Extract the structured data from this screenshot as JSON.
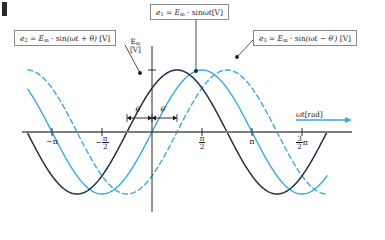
{
  "figure": {
    "title_mark": "corner-mark",
    "colors": {
      "series_e1": "#3aa9dd",
      "series_e2": "#1f3044",
      "series_e3": "#3aa9dd",
      "axis": "#7d7d7d",
      "arrow": "#3aa9dd",
      "box_border": "#8a8a8a",
      "text": "#1a1a1a"
    }
  },
  "callouts": {
    "e1": {
      "id": "callout-e1",
      "text": "e₁ = Em · sinωt[V]",
      "lhs": "e",
      "lhs_sub": "1",
      "eq": "=",
      "amp": "E",
      "amp_sub": "m",
      "dot": "·",
      "rhs": "sin",
      "arg": "ωt",
      "unit": "[V]"
    },
    "e2": {
      "id": "callout-e2",
      "text": "e₂ = Em · sin(ωt + θ) [V]",
      "lhs": "e",
      "lhs_sub": "2",
      "eq": "=",
      "amp": "E",
      "amp_sub": "m",
      "dot": "·",
      "rhs": "sin",
      "arg": "(ωt + θ)",
      "unit": "[V]"
    },
    "e3": {
      "id": "callout-e3",
      "text": "e₃ = Em · sin(ωt − θ′) [V]",
      "lhs": "e",
      "lhs_sub": "3",
      "eq": "=",
      "amp": "E",
      "amp_sub": "m",
      "dot": "·",
      "rhs": "sin",
      "arg": "(ωt − θ′)",
      "unit": "[V]"
    }
  },
  "axes": {
    "y_label_top": "Em",
    "y_label_sym": "E",
    "y_label_sub": "m",
    "y_label_unit": "[V]",
    "x_label": "ωt [rad]",
    "x_label_sym": "ωt",
    "x_label_unit": "[rad]"
  },
  "ticks": [
    {
      "label": "−π",
      "kind": "plain",
      "x_rad": -3.14159
    },
    {
      "label": "−π/2",
      "kind": "frac",
      "sign": "−",
      "num": "π",
      "den": "2",
      "x_rad": -1.5708
    },
    {
      "label": "π/2",
      "kind": "frac",
      "sign": "",
      "num": "π",
      "den": "2",
      "x_rad": 1.5708
    },
    {
      "label": "π",
      "kind": "plain",
      "x_rad": 3.14159
    },
    {
      "label": "3/2 π",
      "kind": "fracpi",
      "sign": "",
      "num": "3",
      "den": "2",
      "suffix": "π",
      "x_rad": 4.71239
    }
  ],
  "angle_annotations": [
    {
      "name": "theta",
      "label": "θ",
      "from_rad": -0.7854,
      "to_rad": 0.0
    },
    {
      "name": "theta-prime",
      "label": "θ′",
      "from_rad": 0.0,
      "to_rad": 0.7854
    }
  ],
  "chart_data": {
    "type": "line",
    "title": "",
    "xlabel": "ωt [rad]",
    "ylabel": "Em [V]",
    "xlim": [
      -3.9,
      5.5
    ],
    "ylim": [
      -1.35,
      1.35
    ],
    "grid": false,
    "legend": "callout-boxes",
    "x_tick_values": [
      -3.14159,
      -1.5708,
      1.5708,
      3.14159,
      4.71239
    ],
    "x_tick_labels": [
      "−π",
      "−π/2",
      "π/2",
      "π",
      "3/2 π"
    ],
    "amplitude": 1.0,
    "phase_theta": 0.7854,
    "phase_theta_prime": 0.7854,
    "series": [
      {
        "name": "e1",
        "label": "e₁ = Em · sinωt[V]",
        "color": "#3aa9dd",
        "style": "solid",
        "phase": 0.0,
        "amplitude": 1.0,
        "description": "reference sine, peak at pi/2"
      },
      {
        "name": "e2",
        "label": "e₂ = Em · sin(ωt + θ) [V]",
        "color": "#1f3044",
        "style": "solid",
        "phase": 0.7854,
        "amplitude": 1.0,
        "description": "leads e1 by theta"
      },
      {
        "name": "e3",
        "label": "e₃ = Em · sin(ωt − θ′) [V]",
        "color": "#3aa9dd",
        "style": "dashed",
        "phase": -0.7854,
        "amplitude": 1.0,
        "description": "lags e1 by theta prime"
      }
    ]
  }
}
